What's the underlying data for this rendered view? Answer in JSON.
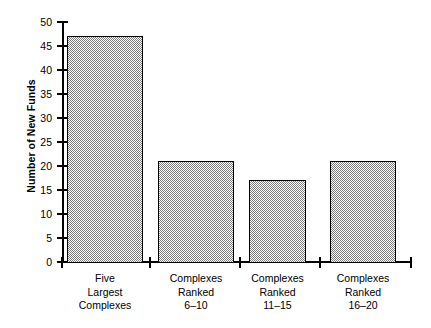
{
  "chart_data": {
    "type": "bar",
    "title": "",
    "xlabel": "",
    "ylabel": "Number of New Funds",
    "ylim": [
      0,
      50
    ],
    "grid": false,
    "legend": false,
    "categories": [
      "Five Largest Complexes",
      "Complexes Ranked 6–10",
      "Complexes Ranked 11–15",
      "Complexes Ranked 16–20"
    ],
    "category_lines": [
      [
        "Five",
        "Largest",
        "Complexes"
      ],
      [
        "Complexes",
        "Ranked",
        "6–10"
      ],
      [
        "Complexes",
        "Ranked",
        "11–15"
      ],
      [
        "Complexes",
        "Ranked",
        "16–20"
      ]
    ],
    "values": [
      47,
      21,
      17,
      21
    ],
    "ytick_labels": [
      "50",
      "45",
      "40",
      "35",
      "30",
      "25",
      "20",
      "15",
      "10",
      "5",
      "0"
    ],
    "ytick_values": [
      50,
      45,
      40,
      35,
      30,
      25,
      20,
      15,
      10,
      5,
      0
    ],
    "bar_fill": "#7c7c7c",
    "bar_edge": "#000000",
    "axis_color": "#000000",
    "background": "#ffffff"
  }
}
